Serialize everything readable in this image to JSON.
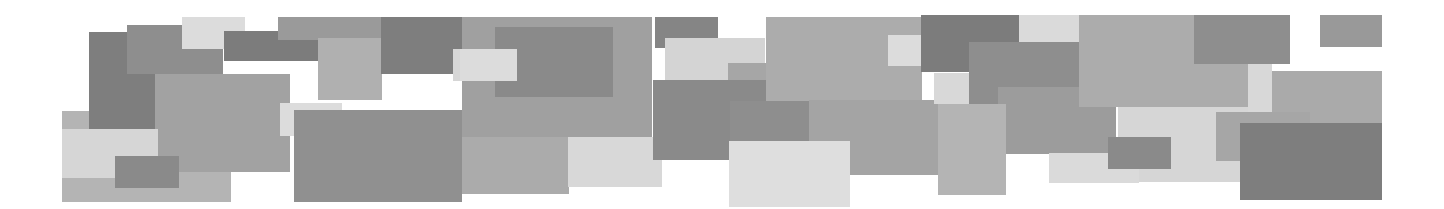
{
  "banner": {
    "width": 1444,
    "height": 209,
    "background": "#ffffff",
    "rects": [
      {
        "x": 62,
        "y": 111,
        "w": 169,
        "h": 91,
        "c": "#b4b4b4"
      },
      {
        "x": 89,
        "y": 32,
        "w": 66,
        "h": 97,
        "c": "#7e7e7e"
      },
      {
        "x": 127,
        "y": 25,
        "w": 96,
        "h": 49,
        "c": "#8e8e8e"
      },
      {
        "x": 182,
        "y": 17,
        "w": 63,
        "h": 32,
        "c": "#dcdcdc"
      },
      {
        "x": 224,
        "y": 31,
        "w": 120,
        "h": 30,
        "c": "#7c7c7c"
      },
      {
        "x": 155,
        "y": 74,
        "w": 135,
        "h": 98,
        "c": "#a2a2a2"
      },
      {
        "x": 62,
        "y": 129,
        "w": 96,
        "h": 49,
        "c": "#d6d6d6"
      },
      {
        "x": 115,
        "y": 156,
        "w": 64,
        "h": 32,
        "c": "#8a8a8a"
      },
      {
        "x": 278,
        "y": 17,
        "w": 106,
        "h": 23,
        "c": "#9a9a9a"
      },
      {
        "x": 318,
        "y": 38,
        "w": 64,
        "h": 62,
        "c": "#b0b0b0"
      },
      {
        "x": 381,
        "y": 17,
        "w": 100,
        "h": 57,
        "c": "#7e7e7e"
      },
      {
        "x": 453,
        "y": 49,
        "w": 30,
        "h": 32,
        "c": "#d6d6d6"
      },
      {
        "x": 280,
        "y": 103,
        "w": 62,
        "h": 33,
        "c": "#dcdcdc"
      },
      {
        "x": 294,
        "y": 110,
        "w": 168,
        "h": 92,
        "c": "#909090"
      },
      {
        "x": 462,
        "y": 17,
        "w": 190,
        "h": 122,
        "c": "#a0a0a0"
      },
      {
        "x": 495,
        "y": 27,
        "w": 118,
        "h": 70,
        "c": "#8a8a8a"
      },
      {
        "x": 460,
        "y": 49,
        "w": 57,
        "h": 32,
        "c": "#dcdcdc"
      },
      {
        "x": 462,
        "y": 137,
        "w": 107,
        "h": 57,
        "c": "#ababab"
      },
      {
        "x": 568,
        "y": 137,
        "w": 94,
        "h": 50,
        "c": "#d8d8d8"
      },
      {
        "x": 655,
        "y": 17,
        "w": 63,
        "h": 31,
        "c": "#858585"
      },
      {
        "x": 665,
        "y": 38,
        "w": 100,
        "h": 42,
        "c": "#d4d4d4"
      },
      {
        "x": 728,
        "y": 63,
        "w": 42,
        "h": 20,
        "c": "#a6a6a6"
      },
      {
        "x": 653,
        "y": 80,
        "w": 156,
        "h": 80,
        "c": "#8a8a8a"
      },
      {
        "x": 730,
        "y": 101,
        "w": 81,
        "h": 40,
        "c": "#8e8e8e"
      },
      {
        "x": 766,
        "y": 17,
        "w": 156,
        "h": 84,
        "c": "#acacac"
      },
      {
        "x": 809,
        "y": 100,
        "w": 130,
        "h": 75,
        "c": "#a4a4a4"
      },
      {
        "x": 729,
        "y": 141,
        "w": 121,
        "h": 66,
        "c": "#dedede"
      },
      {
        "x": 888,
        "y": 35,
        "w": 63,
        "h": 31,
        "c": "#dcdcdc"
      },
      {
        "x": 921,
        "y": 15,
        "w": 98,
        "h": 57,
        "c": "#7c7c7c"
      },
      {
        "x": 934,
        "y": 73,
        "w": 36,
        "h": 31,
        "c": "#d8d8d8"
      },
      {
        "x": 969,
        "y": 42,
        "w": 110,
        "h": 71,
        "c": "#8e8e8e"
      },
      {
        "x": 1019,
        "y": 15,
        "w": 60,
        "h": 27,
        "c": "#dadada"
      },
      {
        "x": 998,
        "y": 87,
        "w": 118,
        "h": 67,
        "c": "#9c9c9c"
      },
      {
        "x": 938,
        "y": 104,
        "w": 68,
        "h": 91,
        "c": "#b4b4b4"
      },
      {
        "x": 1079,
        "y": 15,
        "w": 170,
        "h": 92,
        "c": "#acacac"
      },
      {
        "x": 1118,
        "y": 107,
        "w": 180,
        "h": 75,
        "c": "#d6d6d6"
      },
      {
        "x": 1049,
        "y": 153,
        "w": 90,
        "h": 30,
        "c": "#dadada"
      },
      {
        "x": 1108,
        "y": 137,
        "w": 63,
        "h": 32,
        "c": "#8a8a8a"
      },
      {
        "x": 1194,
        "y": 15,
        "w": 96,
        "h": 49,
        "c": "#8e8e8e"
      },
      {
        "x": 1248,
        "y": 64,
        "w": 24,
        "h": 48,
        "c": "#d8d8d8"
      },
      {
        "x": 1272,
        "y": 71,
        "w": 110,
        "h": 52,
        "c": "#aaaaaa"
      },
      {
        "x": 1216,
        "y": 112,
        "w": 94,
        "h": 49,
        "c": "#a6a6a6"
      },
      {
        "x": 1240,
        "y": 123,
        "w": 142,
        "h": 77,
        "c": "#7e7e7e"
      },
      {
        "x": 1320,
        "y": 15,
        "w": 62,
        "h": 32,
        "c": "#999999"
      }
    ]
  }
}
